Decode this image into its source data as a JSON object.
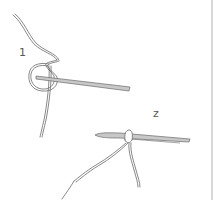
{
  "figure": {
    "steps": [
      {
        "number": "1",
        "caption_label": "1"
      },
      {
        "number": "2",
        "caption_label": "z"
      }
    ]
  },
  "colors": {
    "background": "#ffffff",
    "line": "#6a6a6a",
    "needle_fill": "#c8c8c8",
    "edge": "#d8d8d8"
  }
}
